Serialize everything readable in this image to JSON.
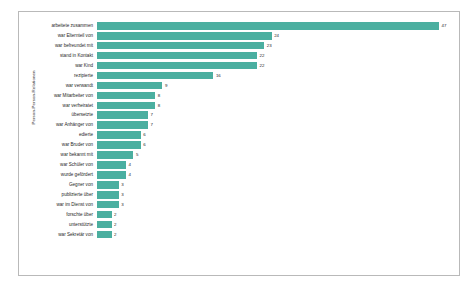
{
  "chart_data": {
    "type": "bar",
    "orientation": "horizontal",
    "title": "",
    "subtitle": "",
    "xlabel": "",
    "ylabel": "Person-Person-Relationen",
    "grid": false,
    "legend": null,
    "bar_color": "#4bafa0",
    "frame_color": "#b9b9b9",
    "background": "#ffffff",
    "xlim": [
      0,
      47
    ],
    "categories": [
      "arbeitete zusammen",
      "war Elternteil von",
      "war befreundet mit",
      "stand in Kontakt",
      "war Kind",
      "rezipierte",
      "war verwandt",
      "war Mitarbeiter von",
      "war verheiratet",
      "übersetzte",
      "war Anhänger von",
      "edierte",
      "war Bruder von",
      "war bekannt mit",
      "war Schüler von",
      "wurde gefördert",
      "Gegner von",
      "publizierte über",
      "war im Dienst von",
      "forschte über",
      "unterstützte",
      "war Sekretär von"
    ],
    "values": [
      47,
      24,
      23,
      22,
      22,
      16,
      9,
      8,
      8,
      7,
      7,
      6,
      6,
      5,
      4,
      4,
      3,
      3,
      3,
      2,
      2,
      2
    ],
    "value_labels": [
      "47",
      "24",
      "23",
      "22",
      "22",
      "16",
      "9",
      "8",
      "8",
      "7",
      "7",
      "6",
      "6",
      "5",
      "4",
      "4",
      "3",
      "3",
      "3",
      "2",
      "2",
      "2"
    ]
  },
  "axis": {
    "y_title": "Person-Person-Relationen",
    "x_tick": ""
  }
}
